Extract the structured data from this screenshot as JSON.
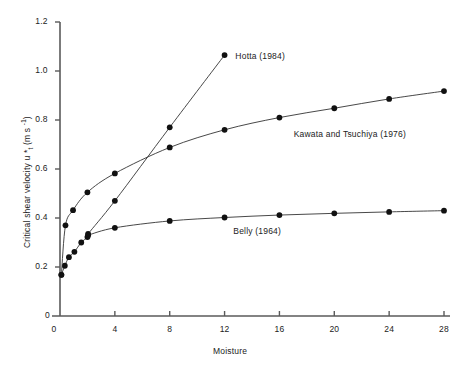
{
  "figure": {
    "background_color": "#ffffff",
    "ink_color": "#1a1a1a"
  },
  "chart_data": {
    "type": "line",
    "title": "",
    "xlabel": "Moisture",
    "ylabel": "Critical shear velocity u *t (m s -1)",
    "ylabel_parts": {
      "main": "Critical shear velocity u ",
      "star": "*",
      "subscript": "t",
      "units_open": " (m s ",
      "units_exp": "-1",
      "units_close": ")"
    },
    "xlim": [
      0,
      28
    ],
    "ylim": [
      0,
      1.2
    ],
    "xticks": [
      0,
      4,
      8,
      12,
      16,
      20,
      24,
      28
    ],
    "xtick_labels": [
      "0",
      "4",
      "8",
      "12",
      "16",
      "20",
      "24",
      "28"
    ],
    "yticks": [
      0,
      0.2,
      0.4,
      0.6,
      0.8,
      1.0,
      1.2
    ],
    "ytick_labels": [
      "0",
      "0.2",
      "0.4",
      "0.6",
      "0.8",
      "1.0",
      "1.2"
    ],
    "grid": false,
    "legend_position": "inline-annotations",
    "marker": "filled-circle",
    "marker_color": "#111111",
    "line_color": "#333333",
    "series": [
      {
        "name": "Hotta (1984)",
        "label": "Hotta  (1984)",
        "label_x": 12.35,
        "label_y": 1.062,
        "points": [
          {
            "x": 0.1,
            "y": 0.168
          },
          {
            "x": 0.35,
            "y": 0.205
          },
          {
            "x": 0.65,
            "y": 0.24
          },
          {
            "x": 1.05,
            "y": 0.262
          },
          {
            "x": 1.55,
            "y": 0.3
          },
          {
            "x": 2.0,
            "y": 0.322
          },
          {
            "x": 2.05,
            "y": 0.335
          },
          {
            "x": 4.0,
            "y": 0.47
          },
          {
            "x": 8.0,
            "y": 0.77
          },
          {
            "x": 12.0,
            "y": 1.065
          }
        ]
      },
      {
        "name": "Kawata and Tsuchiya (1976)",
        "label": "Kawata and Tsuchiya (1976)",
        "label_x": 16.6,
        "label_y": 0.742,
        "points": [
          {
            "x": 0.1,
            "y": 0.168
          },
          {
            "x": 0.4,
            "y": 0.37
          },
          {
            "x": 0.95,
            "y": 0.432
          },
          {
            "x": 2.0,
            "y": 0.505
          },
          {
            "x": 4.0,
            "y": 0.582
          },
          {
            "x": 8.0,
            "y": 0.688
          },
          {
            "x": 12.0,
            "y": 0.76
          },
          {
            "x": 16.0,
            "y": 0.81
          },
          {
            "x": 20.0,
            "y": 0.848
          },
          {
            "x": 24.0,
            "y": 0.886
          },
          {
            "x": 28.0,
            "y": 0.918
          }
        ]
      },
      {
        "name": "Belly (1964)",
        "label": "Belly  (1964)",
        "label_x": 12.2,
        "label_y": 0.345,
        "points": [
          {
            "x": 2.05,
            "y": 0.33
          },
          {
            "x": 4.0,
            "y": 0.36
          },
          {
            "x": 8.0,
            "y": 0.388
          },
          {
            "x": 12.0,
            "y": 0.402
          },
          {
            "x": 16.0,
            "y": 0.412
          },
          {
            "x": 20.0,
            "y": 0.419
          },
          {
            "x": 24.0,
            "y": 0.425
          },
          {
            "x": 28.0,
            "y": 0.43
          }
        ]
      }
    ]
  }
}
